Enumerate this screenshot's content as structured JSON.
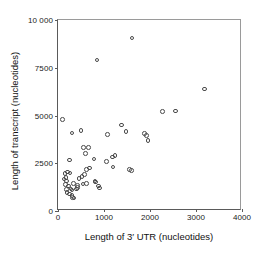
{
  "chart_data": {
    "type": "scatter",
    "title": "",
    "xlabel": "Length of 3′ UTR (nucleotides)",
    "ylabel": "Length of transcript (nucleotides)",
    "xlim": [
      0,
      4000
    ],
    "ylim": [
      0,
      10000
    ],
    "xticks": [
      0,
      1000,
      2000,
      3000,
      4000
    ],
    "yticks": [
      0,
      2500,
      5000,
      7500,
      10000
    ],
    "xtick_labels": [
      "0",
      "1000",
      "2000",
      "3000",
      "4000"
    ],
    "ytick_labels": [
      "0",
      "2500",
      "5000",
      "7500",
      "10 000"
    ],
    "grid": false,
    "legend": null,
    "marker": "open-circle",
    "marker_color": "#4a4a4a",
    "points": [
      [
        100,
        4780
      ],
      [
        250,
        2680
      ],
      [
        300,
        4080
      ],
      [
        500,
        4220
      ],
      [
        560,
        3330
      ],
      [
        600,
        3000
      ],
      [
        660,
        3320
      ],
      [
        680,
        2250
      ],
      [
        620,
        2180
      ],
      [
        580,
        1900
      ],
      [
        520,
        1820
      ],
      [
        460,
        1700
      ],
      [
        430,
        1350
      ],
      [
        540,
        1420
      ],
      [
        620,
        1450
      ],
      [
        780,
        2720
      ],
      [
        800,
        1580
      ],
      [
        820,
        1520
      ],
      [
        850,
        7900
      ],
      [
        900,
        1200
      ],
      [
        880,
        1300
      ],
      [
        1060,
        2600
      ],
      [
        1080,
        4000
      ],
      [
        1180,
        2820
      ],
      [
        1240,
        2900
      ],
      [
        1200,
        2300
      ],
      [
        1380,
        4500
      ],
      [
        1480,
        4150
      ],
      [
        1560,
        2160
      ],
      [
        1600,
        2120
      ],
      [
        1610,
        9050
      ],
      [
        1880,
        4050
      ],
      [
        1930,
        3950
      ],
      [
        1960,
        3700
      ],
      [
        2270,
        5200
      ],
      [
        2560,
        5240
      ],
      [
        3180,
        6380
      ],
      [
        150,
        1950
      ],
      [
        170,
        1750
      ],
      [
        190,
        1580
      ],
      [
        160,
        1380
      ],
      [
        210,
        2050
      ],
      [
        260,
        2000
      ],
      [
        230,
        1300
      ],
      [
        280,
        1150
      ],
      [
        300,
        1100
      ],
      [
        250,
        880
      ],
      [
        300,
        820
      ],
      [
        320,
        700
      ],
      [
        350,
        690
      ],
      [
        400,
        1150
      ],
      [
        420,
        1220
      ],
      [
        130,
        1680
      ],
      [
        180,
        1120
      ],
      [
        200,
        980
      ],
      [
        340,
        1450
      ]
    ]
  }
}
